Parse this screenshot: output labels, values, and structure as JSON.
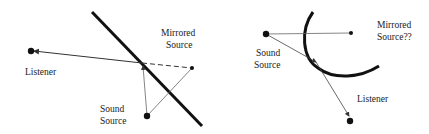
{
  "left_diagram": {
    "labels": {
      "listener": "Listener",
      "mirrored_1": "Mirrored",
      "mirrored_2": "Source",
      "sound_1": "Sound",
      "sound_2": "Source"
    }
  },
  "right_diagram": {
    "labels": {
      "sound_1": "Sound",
      "sound_2": "Source",
      "mirrored_1": "Mirrored",
      "mirrored_2": "Source??",
      "listener": "Listener"
    }
  },
  "colors": {
    "stroke": "#111111",
    "thin": "#555555",
    "background": "#ffffff"
  }
}
